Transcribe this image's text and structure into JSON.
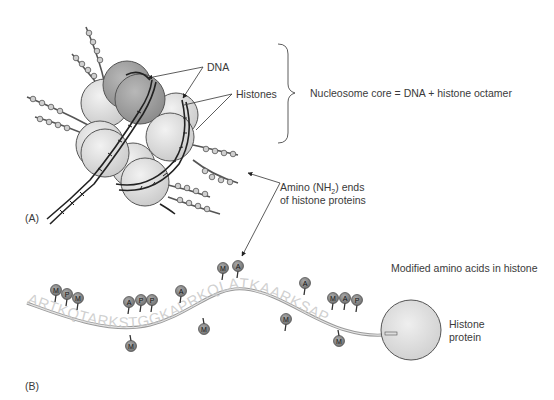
{
  "panel_a": {
    "panel_label": "(A)",
    "labels": {
      "dna": "DNA",
      "histones": "Histones",
      "nucleosome_core": "Nucleosome core = DNA + histone octamer",
      "amino_ends_line1_prefix": "Amino (NH",
      "amino_ends_sub": "2",
      "amino_ends_line1_suffix": ") ends",
      "amino_ends_line2": "of histone proteins"
    }
  },
  "panel_b": {
    "panel_label": "(B)",
    "title": "Modified amino acids in histone",
    "sequence": "ARTKQTARKSTGGKAPRKQLATKAARKSAP",
    "histone_protein_line1": "Histone",
    "histone_protein_line2": "protein",
    "modifications": [
      {
        "mark": "M",
        "x": 56,
        "y": 290
      },
      {
        "mark": "P",
        "x": 67,
        "y": 294
      },
      {
        "mark": "M",
        "x": 78,
        "y": 298
      },
      {
        "mark": "A",
        "x": 129,
        "y": 302
      },
      {
        "mark": "P",
        "x": 141,
        "y": 300
      },
      {
        "mark": "P",
        "x": 152,
        "y": 300
      },
      {
        "mark": "M",
        "x": 131,
        "y": 346
      },
      {
        "mark": "A",
        "x": 181,
        "y": 291
      },
      {
        "mark": "M",
        "x": 204,
        "y": 329
      },
      {
        "mark": "M",
        "x": 223,
        "y": 268
      },
      {
        "mark": "A",
        "x": 238,
        "y": 266
      },
      {
        "mark": "A",
        "x": 305,
        "y": 283
      },
      {
        "mark": "M",
        "x": 286,
        "y": 319
      },
      {
        "mark": "M",
        "x": 333,
        "y": 298
      },
      {
        "mark": "A",
        "x": 345,
        "y": 298
      },
      {
        "mark": "P",
        "x": 357,
        "y": 300
      },
      {
        "mark": "M",
        "x": 339,
        "y": 341
      }
    ],
    "legend_marks": {
      "M": "methylation",
      "A": "acetylation",
      "P": "phosphorylation"
    }
  },
  "colors": {
    "histone_light": "#d9d9d9",
    "histone_dark": "#9a9a9a",
    "mark_fill": "#8c8c8c",
    "line": "#444444",
    "text": "#3a3a3a"
  }
}
